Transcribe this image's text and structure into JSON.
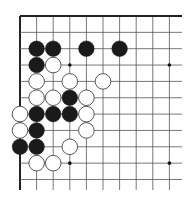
{
  "board": {
    "view": "upper-left corner",
    "columns_visible": 10,
    "rows_visible": 11,
    "origin_x": 20,
    "origin_y": 16,
    "spacing_x": 16.6,
    "spacing_y": 16.35,
    "extent_x": 182,
    "extent_y": 190,
    "stone_radius": 7.8,
    "colors": {
      "background": "#ffffff",
      "grid_line": "#555555",
      "edge_line": "#222222",
      "black_stone": "#1a1a1a",
      "white_stone_fill": "#ffffff",
      "white_stone_outline": "#444444",
      "hoshi": "#111111"
    },
    "hoshi": [
      {
        "col": 3,
        "row": 3
      },
      {
        "col": 9,
        "row": 3
      },
      {
        "col": 3,
        "row": 9
      },
      {
        "col": 9,
        "row": 9
      }
    ],
    "stones": [
      {
        "color": "black",
        "col": 1,
        "row": 2
      },
      {
        "color": "black",
        "col": 2,
        "row": 2
      },
      {
        "color": "black",
        "col": 4,
        "row": 2
      },
      {
        "color": "black",
        "col": 6,
        "row": 2
      },
      {
        "color": "black",
        "col": 1,
        "row": 3
      },
      {
        "color": "white",
        "col": 2,
        "row": 3
      },
      {
        "color": "white",
        "col": 1,
        "row": 4
      },
      {
        "color": "white",
        "col": 3,
        "row": 4
      },
      {
        "color": "white",
        "col": 5,
        "row": 4
      },
      {
        "color": "white",
        "col": 1,
        "row": 5
      },
      {
        "color": "white",
        "col": 2,
        "row": 5
      },
      {
        "color": "black",
        "col": 3,
        "row": 5
      },
      {
        "color": "white",
        "col": 4,
        "row": 5
      },
      {
        "color": "white",
        "col": 0,
        "row": 6
      },
      {
        "color": "black",
        "col": 1,
        "row": 6
      },
      {
        "color": "black",
        "col": 2,
        "row": 6
      },
      {
        "color": "black",
        "col": 3,
        "row": 6
      },
      {
        "color": "white",
        "col": 4,
        "row": 6
      },
      {
        "color": "white",
        "col": 0,
        "row": 7
      },
      {
        "color": "black",
        "col": 1,
        "row": 7
      },
      {
        "color": "white",
        "col": 4,
        "row": 7
      },
      {
        "color": "black",
        "col": 0,
        "row": 8
      },
      {
        "color": "black",
        "col": 1,
        "row": 8
      },
      {
        "color": "white",
        "col": 3,
        "row": 8
      },
      {
        "color": "white",
        "col": 1,
        "row": 9
      },
      {
        "color": "white",
        "col": 2,
        "row": 9
      }
    ]
  }
}
